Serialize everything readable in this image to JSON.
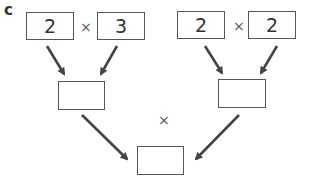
{
  "label": "c",
  "operator": "×",
  "left_group": {
    "a": "2",
    "b": "3",
    "result": ""
  },
  "right_group": {
    "a": "2",
    "b": "2",
    "result": ""
  },
  "final_result": ""
}
